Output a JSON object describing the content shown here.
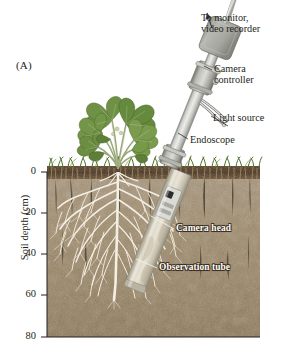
{
  "figure": {
    "panel_label": "(A)",
    "background_color": "#ffffff",
    "caption_text_color": "#231f20"
  },
  "callouts": [
    {
      "name": "to-monitor",
      "text": "To monitor,\nvideo recorder",
      "color": "#231f20"
    },
    {
      "name": "camera-controller",
      "text": "Camera\ncontroller",
      "color": "#231f20"
    },
    {
      "name": "light-source",
      "text": "Light source",
      "color": "#231f20"
    },
    {
      "name": "endoscope",
      "text": "Endoscope",
      "color": "#231f20"
    },
    {
      "name": "camera-head",
      "text": "Camera head",
      "color": "#ffffff"
    },
    {
      "name": "observation-tube",
      "text": "Observation tube",
      "color": "#ffffff"
    }
  ],
  "labels": {
    "to_monitor": "To monitor,\nvideo recorder",
    "camera_controller": "Camera\ncontroller",
    "light_source": "Light source",
    "endoscope": "Endoscope",
    "camera_head": "Camera head",
    "observation_tube": "Observation tube"
  },
  "axis": {
    "title": "Soil depth (cm)",
    "units": "cm",
    "ticks": [
      "0",
      "20",
      "40",
      "60",
      "80"
    ],
    "tick_values": [
      0,
      20,
      40,
      60,
      80
    ],
    "range": [
      0,
      80
    ],
    "orientation": "vertical-inverted"
  },
  "scene": {
    "plant": {
      "name": "clover-plant",
      "leaf_color": "#6f9145",
      "stem_color": "#9aa77b"
    },
    "grass": {
      "color": "#5f7f33"
    },
    "topsoil": {
      "color": "#4b3420"
    },
    "subsoil": {
      "color": "#9c8866"
    },
    "roots": {
      "color": "#f3ece0"
    },
    "tube": {
      "body_color": "#d8d9d4",
      "collar_color": "#a8a9a4",
      "buried_color": "#cfc9b8"
    },
    "controller": {
      "color": "#a9aaa5"
    },
    "cable": {
      "color": "#d9d9d6"
    }
  }
}
